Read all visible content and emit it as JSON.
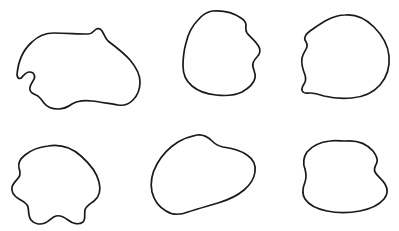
{
  "canvas": {
    "width": 399,
    "height": 231,
    "background_color": "#ffffff",
    "title": "Six hand-drawn closed blob outlines"
  },
  "style": {
    "stroke_color": "#1a1a1a",
    "stroke_width": 1.7,
    "fill": "none"
  },
  "shapes": [
    {
      "id": "blob-1",
      "label": "blob-top-left",
      "row": "top",
      "column": "left",
      "bbox": {
        "x": 17,
        "y": 27,
        "width": 124,
        "height": 84
      },
      "description": "wide irregular lumpy outline with peak at top right and notched wavy bottom left",
      "path": "M 17,75 C 18,62 23,50 32,42 C 38,36 45,33 54,33 C 66,33 78,34 88,34 C 92,34 93,32 95,30 C 97,28 100,28 102,31 C 104,34 105,38 108,41 C 116,47 124,53 130,60 C 136,67 140,74 140,82 C 140,90 137,96 133,100 C 129,104 124,106 118,105 C 110,104 101,102 92,101 C 84,100 77,101 72,104 C 68,107 64,109 58,109 C 52,109 47,107 44,103 C 41,99 39,96 36,95 C 33,94 31,93 30,90 C 29,87 31,84 33,81 C 35,78 35,75 33,73 C 30,71 26,72 23,76 C 21,79 18,80 17,75 Z"
    },
    {
      "id": "blob-2",
      "label": "blob-top-center",
      "row": "top",
      "column": "center",
      "bbox": {
        "x": 183,
        "y": 10,
        "width": 80,
        "height": 86
      },
      "description": "rounded near-circular outline with small corner notch at top right and wavy right edge",
      "path": "M 212,11 C 224,10 234,13 241,18 C 244,20 246,22 246,25 C 246,28 245,30 247,33 C 250,37 256,41 259,47 C 261,51 260,54 257,57 C 254,60 252,63 253,67 C 254,71 256,74 255,78 C 254,83 249,88 242,92 C 234,96 225,96 216,95 C 206,94 198,91 192,86 C 186,81 183,74 183,66 C 183,58 184,50 186,43 C 188,34 192,26 198,20 C 202,15 207,12 212,11 Z"
    },
    {
      "id": "blob-3",
      "label": "blob-top-right",
      "row": "top",
      "column": "right",
      "bbox": {
        "x": 301,
        "y": 14,
        "width": 89,
        "height": 85
      },
      "description": "rounded rock-like outline with a concave notch on the upper left edge",
      "path": "M 345,15 C 356,14 366,19 374,27 C 382,35 388,45 389,56 C 390,67 387,77 380,85 C 373,93 363,97 352,98 C 342,99 332,98 324,96 C 318,94 313,93 310,93 C 307,93 305,94 303,92 C 301,90 302,87 304,84 C 306,81 306,78 305,75 C 303,70 301,64 302,58 C 303,53 306,50 307,47 C 308,44 306,42 305,40 C 304,37 306,34 310,31 C 316,27 321,23 327,20 C 333,17 339,15 345,15 Z"
    },
    {
      "id": "blob-4",
      "label": "blob-bottom-left",
      "row": "bottom",
      "column": "left",
      "bbox": {
        "x": 12,
        "y": 145,
        "width": 88,
        "height": 80
      },
      "description": "cloud or clover-like outline with three rounded lobes along the bottom edge",
      "path": "M 48,146 C 60,144 72,148 81,156 C 90,164 97,173 99,182 C 101,190 99,197 94,201 C 90,204 86,206 85,210 C 84,215 86,219 83,222 C 79,225 73,224 68,220 C 64,217 60,215 56,216 C 52,217 50,221 45,223 C 40,225 34,224 31,220 C 28,216 29,211 28,207 C 27,203 23,201 19,199 C 14,196 11,192 12,187 C 13,183 17,180 19,177 C 21,174 20,171 19,168 C 18,164 20,159 25,155 C 31,150 40,147 48,146 Z"
    },
    {
      "id": "blob-5",
      "label": "blob-bottom-center",
      "row": "bottom",
      "column": "center",
      "bbox": {
        "x": 152,
        "y": 134,
        "width": 104,
        "height": 81
      },
      "description": "tilted egg or teardrop outline, wider at the right with a rounded point at lower left",
      "path": "M 197,135 C 204,134 208,137 212,141 C 215,144 218,146 223,147 C 231,148 240,150 247,155 C 253,159 256,165 255,172 C 254,179 250,185 244,190 C 237,196 228,200 218,203 C 208,206 197,209 188,212 C 180,215 172,215 166,211 C 159,207 154,200 152,192 C 150,183 152,173 157,164 C 162,155 170,147 178,142 C 185,138 192,136 197,135 Z"
    },
    {
      "id": "blob-6",
      "label": "blob-bottom-right",
      "row": "bottom",
      "column": "right",
      "bbox": {
        "x": 303,
        "y": 140,
        "width": 86,
        "height": 73
      },
      "description": "rounded boulder outline with a small indentation on the right side",
      "path": "M 345,141 C 357,140 367,144 373,151 C 376,155 378,158 377,162 C 376,166 373,168 375,172 C 377,176 382,179 385,184 C 388,189 388,194 384,199 C 379,205 370,209 360,211 C 349,213 337,213 327,211 C 317,209 309,205 305,199 C 301,193 303,187 305,182 C 307,177 306,173 305,169 C 303,164 303,158 307,152 C 312,146 321,142 330,141 C 335,140 341,141 345,141 Z"
    }
  ]
}
